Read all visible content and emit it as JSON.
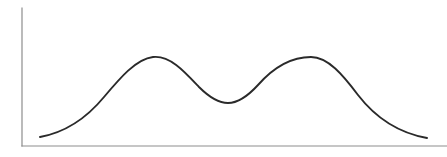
{
  "figure": {
    "title": "",
    "background_color": "#ffffff",
    "width": 447,
    "height": 157
  },
  "axes": {
    "axis_color": "#8d8d8d",
    "axis_stroke_width": 1.2,
    "y_axis": {
      "name": "y-axis",
      "x": 22,
      "y_top": 8,
      "y_bottom": 146,
      "label": "",
      "ticks": [],
      "tick_labels": []
    },
    "x_axis": {
      "name": "x-axis",
      "y": 146,
      "x_left": 22,
      "x_right": 447,
      "label": "",
      "ticks": [],
      "tick_labels": []
    }
  },
  "curve": {
    "name": "bimodal-density-curve",
    "color": "#2a2a2a",
    "stroke_width": 1.9,
    "path": "M 40 137 C 62 133 85 120 104 97 C 120 78 136 59 153 57 C 170 55 185 72 199 87 C 210 98 219 103 228 103 C 238 103 247 97 258 85 C 273 68 291 57 311 57 C 328 57 343 75 358 95 C 375 117 399 133 427 138"
  },
  "chart_data": {
    "type": "line",
    "title": "",
    "subtitle": "",
    "xlabel": "",
    "ylabel": "",
    "grid": false,
    "legend": false,
    "legend_position": "none",
    "xlim": [
      0,
      100
    ],
    "ylim": [
      0,
      100
    ],
    "series": [
      {
        "name": "density",
        "x": [
          0,
          5,
          10,
          15,
          20,
          25,
          29,
          34,
          39,
          44,
          48,
          53,
          58,
          63,
          68,
          73,
          78,
          83,
          88,
          93,
          100
        ],
        "y": [
          7,
          10,
          15,
          23,
          34,
          48,
          60,
          65,
          63,
          54,
          43,
          35,
          34,
          40,
          52,
          62,
          65,
          60,
          48,
          33,
          6
        ]
      }
    ],
    "features": {
      "peaks": [
        {
          "name": "left-peak",
          "x": 34,
          "y": 65
        },
        {
          "name": "right-peak",
          "x": 72,
          "y": 65
        }
      ],
      "valley": {
        "name": "central-valley",
        "x": 53,
        "y": 34
      },
      "start_point": {
        "x": 4,
        "y": 7
      },
      "end_point": {
        "x": 96,
        "y": 6
      }
    }
  }
}
